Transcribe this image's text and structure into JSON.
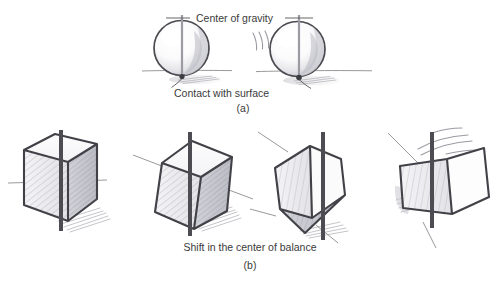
{
  "figure": {
    "title_alt": "Center of gravity and balance diagram",
    "panels": [
      {
        "id": "a",
        "label": "(a)",
        "subject": "spheres",
        "annotations": [
          {
            "name": "center-of-gravity",
            "text": "Center of gravity"
          },
          {
            "name": "contact-with-surface",
            "text": "Contact with surface"
          }
        ],
        "objects": [
          {
            "name": "sphere-upright",
            "state": "balanced"
          },
          {
            "name": "sphere-tilted",
            "state": "rocking"
          }
        ]
      },
      {
        "id": "b",
        "label": "(b)",
        "subject": "cubes",
        "annotations": [
          {
            "name": "shift-in-center-of-balance",
            "text": "Shift in the center of balance"
          }
        ],
        "objects": [
          {
            "name": "cube-upright",
            "state": "balanced"
          },
          {
            "name": "cube-tilted-slight",
            "state": "tipping"
          },
          {
            "name": "cube-on-corner",
            "state": "on-corner"
          },
          {
            "name": "cube-falling",
            "state": "falling"
          }
        ]
      }
    ],
    "footer_caption": ""
  },
  "colors": {
    "ink": "#414147",
    "rod_dark": "#4c4c52",
    "rod_light": "#9b9ba4",
    "ground": "#8d8d8d",
    "hatch": "#9a9aa2",
    "paper": "#ffffff"
  }
}
